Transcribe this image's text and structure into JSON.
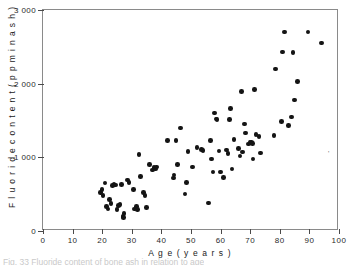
{
  "figure": {
    "caption_partial": "Fig. 33  Fluoride content of bone ash in relation to age",
    "stray_mark_glyph": "'"
  },
  "chart_data": {
    "type": "scatter",
    "title": "",
    "xlabel": "A g e   ( y e a r s )",
    "ylabel": "F l u o r i d e   c o n t e n t   ( p p m  i n  a s h )",
    "xlim": [
      0,
      100
    ],
    "ylim": [
      0,
      3000
    ],
    "grid": false,
    "legend": null,
    "xticks": [
      0,
      10,
      20,
      30,
      40,
      50,
      60,
      70,
      80,
      90,
      100
    ],
    "xtick_labels": [
      "0",
      "10",
      "20",
      "30",
      "40",
      "50",
      "60",
      "70",
      "80",
      "90",
      "100"
    ],
    "yticks": [
      0,
      1000,
      2000,
      3000
    ],
    "ytick_labels": [
      "0",
      "1 000",
      "2 000",
      "3 000"
    ],
    "marker": "filled-circle",
    "marker_color": "#141414",
    "points": [
      [
        19.5,
        520
      ],
      [
        20.0,
        560
      ],
      [
        20.3,
        480
      ],
      [
        21.0,
        650
      ],
      [
        21.5,
        330
      ],
      [
        22.0,
        300
      ],
      [
        22.5,
        430
      ],
      [
        23.0,
        370
      ],
      [
        23.5,
        620
      ],
      [
        24.0,
        630
      ],
      [
        24.5,
        625
      ],
      [
        25.0,
        295
      ],
      [
        25.5,
        350
      ],
      [
        26.0,
        360
      ],
      [
        26.5,
        630
      ],
      [
        27.0,
        200
      ],
      [
        27.2,
        185
      ],
      [
        27.4,
        235
      ],
      [
        28.5,
        690
      ],
      [
        29.0,
        660
      ],
      [
        30.5,
        560
      ],
      [
        31.0,
        300
      ],
      [
        31.5,
        330
      ],
      [
        32.0,
        290
      ],
      [
        32.5,
        1040
      ],
      [
        33.0,
        740
      ],
      [
        34.0,
        520
      ],
      [
        34.5,
        480
      ],
      [
        35.0,
        320
      ],
      [
        36.0,
        900
      ],
      [
        37.0,
        830
      ],
      [
        37.5,
        860
      ],
      [
        38.0,
        840
      ],
      [
        38.3,
        870
      ],
      [
        42.0,
        1230
      ],
      [
        44.0,
        720
      ],
      [
        44.3,
        760
      ],
      [
        45.0,
        1225
      ],
      [
        45.5,
        900
      ],
      [
        46.5,
        1400
      ],
      [
        48.0,
        500
      ],
      [
        48.5,
        660
      ],
      [
        49.0,
        1080
      ],
      [
        50.5,
        870
      ],
      [
        52.0,
        1130
      ],
      [
        53.5,
        1110
      ],
      [
        54.0,
        1090
      ],
      [
        56.0,
        380
      ],
      [
        56.5,
        1230
      ],
      [
        57.0,
        980
      ],
      [
        57.5,
        800
      ],
      [
        58.0,
        1600
      ],
      [
        58.5,
        1520
      ],
      [
        58.8,
        1510
      ],
      [
        59.5,
        1085
      ],
      [
        60.0,
        800
      ],
      [
        61.0,
        730
      ],
      [
        62.0,
        1100
      ],
      [
        62.5,
        1050
      ],
      [
        63.0,
        1510
      ],
      [
        63.3,
        1660
      ],
      [
        63.8,
        840
      ],
      [
        64.5,
        1240
      ],
      [
        66.0,
        1120
      ],
      [
        66.5,
        1020
      ],
      [
        67.0,
        1890
      ],
      [
        67.3,
        1075
      ],
      [
        68.0,
        1450
      ],
      [
        68.5,
        1330
      ],
      [
        69.5,
        1180
      ],
      [
        70.0,
        1210
      ],
      [
        70.5,
        1200
      ],
      [
        70.8,
        1190
      ],
      [
        71.0,
        975
      ],
      [
        71.5,
        1920
      ],
      [
        72.0,
        1310
      ],
      [
        73.0,
        1280
      ],
      [
        73.5,
        1060
      ],
      [
        78.0,
        1300
      ],
      [
        78.5,
        2200
      ],
      [
        80.5,
        1490
      ],
      [
        81.0,
        2430
      ],
      [
        81.5,
        2700
      ],
      [
        83.0,
        1430
      ],
      [
        84.0,
        1550
      ],
      [
        84.5,
        2420
      ],
      [
        85.0,
        1780
      ],
      [
        86.0,
        2030
      ],
      [
        89.5,
        2700
      ],
      [
        94.0,
        2550
      ]
    ]
  }
}
